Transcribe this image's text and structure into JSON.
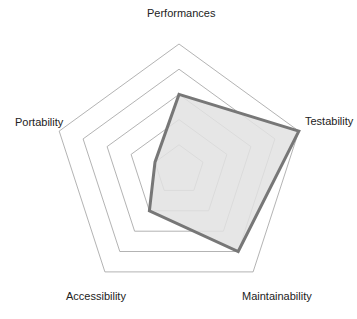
{
  "chart_data": {
    "type": "radar",
    "title": "",
    "axes": [
      "Performances",
      "Testability",
      "Maintainability",
      "Accessibility",
      "Portability"
    ],
    "range": [
      0,
      5
    ],
    "rings": 5,
    "grid": true,
    "legend": null,
    "series": [
      {
        "name": "",
        "values": [
          3,
          5,
          4,
          2,
          1
        ]
      }
    ]
  },
  "style": {
    "fill": "#e2e2e2",
    "stroke": "#777777",
    "grid": "#a0a0a0"
  },
  "labels": {
    "performances": "Performances",
    "testability": "Testability",
    "maintainability": "Maintainability",
    "accessibility": "Accessibility",
    "portability": "Portability"
  }
}
